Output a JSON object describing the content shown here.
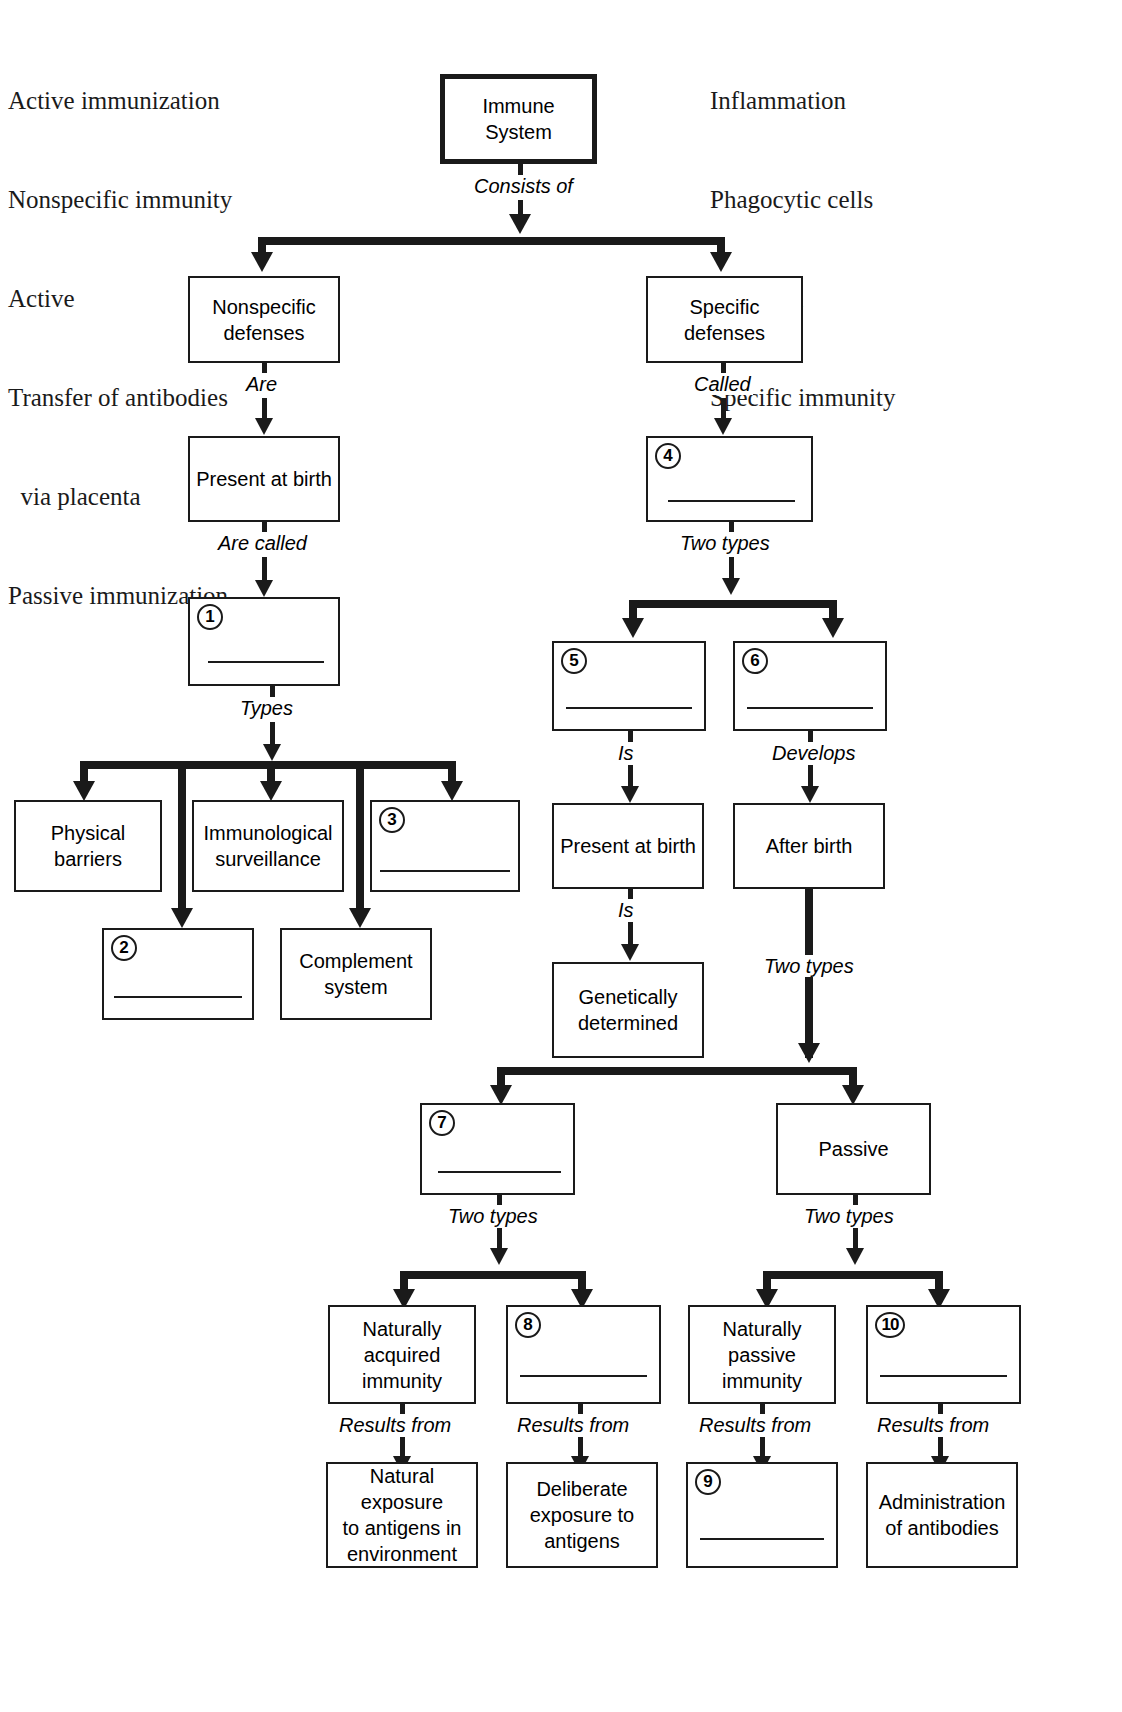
{
  "top_partial_text": "p y g p",
  "wordbank": {
    "left": [
      "Active immunization",
      "Nonspecific immunity",
      "Active",
      "Transfer of antibodies",
      "  via placenta",
      "Passive immunization"
    ],
    "right": [
      "Inflammation",
      "Phagocytic cells",
      "Acquired",
      "Specific immunity",
      "Innate"
    ]
  },
  "nodes": {
    "root": "Immune\nSystem",
    "nonspecific_defenses": "Nonspecific\ndefenses",
    "specific_defenses": "Specific\ndefenses",
    "present_at_birth_left": "Present at birth",
    "blank1": "",
    "physical_barriers": "Physical\nbarriers",
    "immunological_surveillance": "Immunological\nsurveillance",
    "blank3": "",
    "blank2": "",
    "complement_system": "Complement\nsystem",
    "blank4": "",
    "blank5": "",
    "blank6": "",
    "present_at_birth_right": "Present at birth",
    "after_birth": "After birth",
    "genetically_determined": "Genetically\ndetermined",
    "blank7": "",
    "passive": "Passive",
    "naturally_acquired_immunity": "Naturally\nacquired\nimmunity",
    "blank8": "",
    "naturally_passive_immunity": "Naturally\npassive\nimmunity",
    "blank10": "",
    "natural_exposure": "Natural exposure\nto antigens in\nenvironment",
    "deliberate_exposure": "Deliberate\nexposure to\nantigens",
    "blank9": "",
    "administration_of_antibodies": "Administration\nof antibodies"
  },
  "numbers": {
    "n1": "1",
    "n2": "2",
    "n3": "3",
    "n4": "4",
    "n5": "5",
    "n6": "6",
    "n7": "7",
    "n8": "8",
    "n9": "9",
    "n10": "10"
  },
  "edge_labels": {
    "consists_of": "Consists of",
    "are": "Are",
    "called": "Called",
    "are_called": "Are called",
    "two_types_specific": "Two types",
    "types": "Types",
    "is_left": "Is",
    "develops": "Develops",
    "is_right": "Is",
    "two_types_after_birth": "Two types",
    "two_types_active": "Two types",
    "two_types_passive": "Two types",
    "results_from_1": "Results from",
    "results_from_2": "Results from",
    "results_from_3": "Results from",
    "results_from_4": "Results from"
  },
  "colors": {
    "ink": "#1a1a1a",
    "page": "#ffffff"
  }
}
